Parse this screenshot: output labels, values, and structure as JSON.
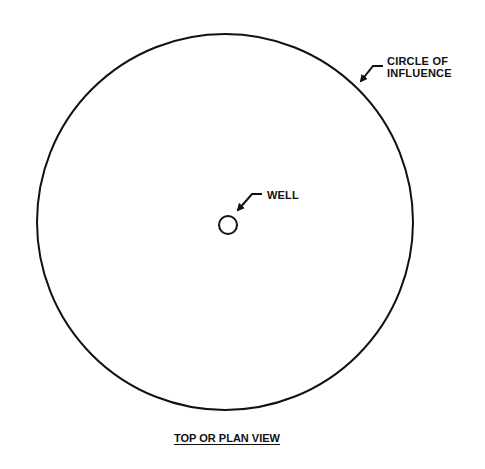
{
  "diagram": {
    "type": "plan-view",
    "labels": {
      "circle_of_influence_line1": "CIRCLE OF",
      "circle_of_influence_line2": "INFLUENCE",
      "well": "WELL"
    },
    "caption": "TOP OR PLAN VIEW",
    "colors": {
      "stroke": "#111111",
      "background": "#ffffff"
    }
  }
}
